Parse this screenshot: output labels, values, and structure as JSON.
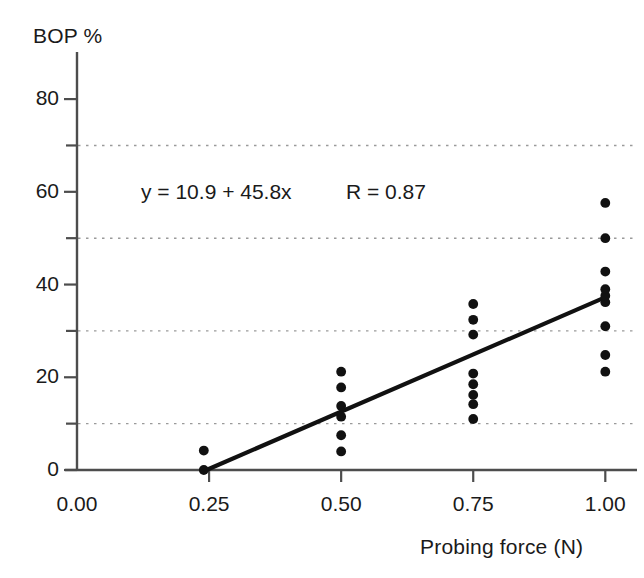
{
  "chart_data": {
    "type": "scatter",
    "title": "",
    "xlabel": "Probing force (N)",
    "ylabel": "BOP %",
    "xlim": [
      0.0,
      1.06
    ],
    "ylim": [
      0,
      88
    ],
    "xticks": [
      0.0,
      0.25,
      0.5,
      0.75,
      1.0
    ],
    "xtick_labels": [
      "0.00",
      "0.25",
      "0.50",
      "0.75",
      "1.00"
    ],
    "yticks": [
      0,
      20,
      40,
      60,
      80
    ],
    "ytick_labels": [
      "0",
      "20",
      "40",
      "60",
      "80"
    ],
    "minor_yticks": [
      10,
      30,
      50,
      70
    ],
    "gridlines": {
      "horizontal_dotted_at": [
        10,
        30,
        50,
        70
      ],
      "vertical": false
    },
    "marker": {
      "shape": "circle",
      "color": "#111111",
      "size": 9
    },
    "points": [
      {
        "x": 0.24,
        "y": 0.0
      },
      {
        "x": 0.24,
        "y": 4.2
      },
      {
        "x": 0.5,
        "y": 4.0
      },
      {
        "x": 0.5,
        "y": 7.5
      },
      {
        "x": 0.5,
        "y": 11.5
      },
      {
        "x": 0.5,
        "y": 13.8
      },
      {
        "x": 0.5,
        "y": 17.8
      },
      {
        "x": 0.5,
        "y": 21.2
      },
      {
        "x": 0.75,
        "y": 11.0
      },
      {
        "x": 0.75,
        "y": 14.2
      },
      {
        "x": 0.75,
        "y": 16.2
      },
      {
        "x": 0.75,
        "y": 18.5
      },
      {
        "x": 0.75,
        "y": 20.8
      },
      {
        "x": 0.75,
        "y": 29.2
      },
      {
        "x": 0.75,
        "y": 32.4
      },
      {
        "x": 0.75,
        "y": 35.8
      },
      {
        "x": 1.0,
        "y": 21.2
      },
      {
        "x": 1.0,
        "y": 24.8
      },
      {
        "x": 1.0,
        "y": 31.0
      },
      {
        "x": 1.0,
        "y": 36.2
      },
      {
        "x": 1.0,
        "y": 37.6
      },
      {
        "x": 1.0,
        "y": 39.0
      },
      {
        "x": 1.0,
        "y": 42.8
      },
      {
        "x": 1.0,
        "y": 50.0
      },
      {
        "x": 1.0,
        "y": 57.6
      }
    ],
    "fit_line": {
      "equation": "y = 10.9 + 45.8x",
      "intercept": 10.9,
      "slope": 45.8,
      "correlation_label": "R = 0.87",
      "correlation": 0.87,
      "x_start": 0.245,
      "x_end": 1.005,
      "y_start": 0.0,
      "y_end": 37.5,
      "color": "#111111"
    }
  },
  "annotations": {
    "equation": "y = 10.9 + 45.8x",
    "correlation": "R = 0.87"
  },
  "axes": {
    "y_title": "BOP %",
    "x_title": "Probing force (N)"
  },
  "colors": {
    "axis": "#4d4d4d",
    "grid": "#9a9a9a",
    "marker": "#111111",
    "line": "#111111",
    "text": "#1a1a1a",
    "background": "#ffffff"
  }
}
